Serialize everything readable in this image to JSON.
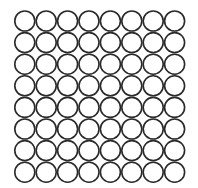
{
  "figure": {
    "rows": 8,
    "cols": 8,
    "stroke_color": "#2a2a2a",
    "fill_color": "#ffffff",
    "background": "#ffffff"
  }
}
